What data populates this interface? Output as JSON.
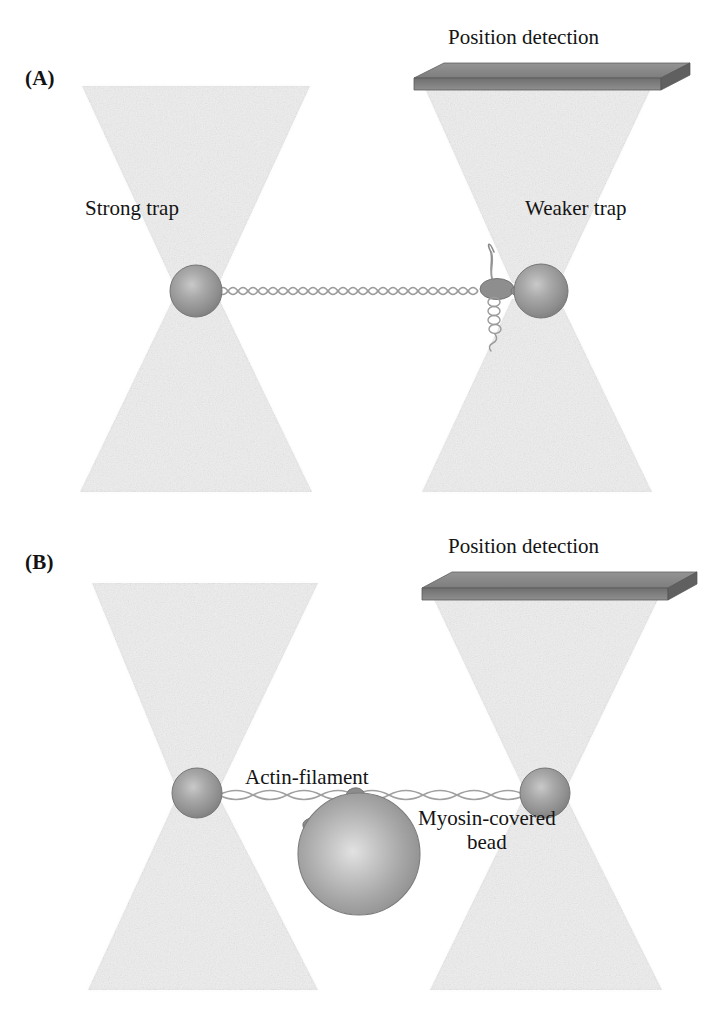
{
  "figure": {
    "background": "#ffffff",
    "width": 717,
    "height": 1025
  },
  "colors": {
    "beam": "#ededed",
    "beam_edge": "#e2e2e2",
    "bead": "#9a9a9a",
    "bead_highlight": "#c2c2c2",
    "bead_edge": "#7a7a7a",
    "detector_top": "#8a8a8a",
    "detector_front": "#6e6e6e",
    "detector_edge": "#5a5a5a",
    "filament": "#9b9b9b",
    "protein": "#8e8e8e",
    "text": "#141414"
  },
  "panels": [
    {
      "id": "A",
      "label": "(A)",
      "detector_label": "Position detection",
      "left_trap_label": "Strong trap",
      "right_trap_label": "Weaker trap",
      "tether_type": "dna-double-helix",
      "tether_label": null,
      "has_molecular_complex": true
    },
    {
      "id": "B",
      "label": "(B)",
      "detector_label": "Position detection",
      "left_trap_label": null,
      "right_trap_label": null,
      "tether_type": "actin-filament",
      "tether_label": "Actin-filament",
      "bead_label_line1": "Myosin-covered",
      "bead_label_line2": "bead",
      "has_molecular_complex": false
    }
  ]
}
